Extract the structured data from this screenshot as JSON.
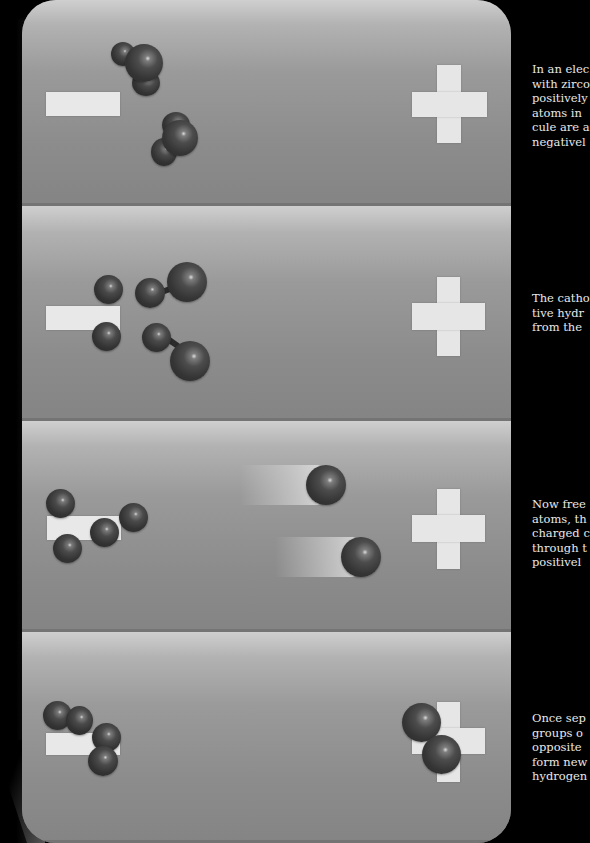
{
  "diagram": {
    "panels": [
      {
        "id": "panel-1",
        "cathode_symbol": "minus",
        "anode_symbol": "plus",
        "caption": "In an elec\nwith zirco\npositively\natoms in \ncule are a\nnegativel",
        "description": "Two water molecules approach the negative electrode"
      },
      {
        "id": "panel-2",
        "cathode_symbol": "minus",
        "anode_symbol": "plus",
        "caption": "The catho\ntive hydr\nfrom the ",
        "description": "Hydrogen atoms are pulled off, leaving oxygen ions bonded"
      },
      {
        "id": "panel-3",
        "cathode_symbol": "minus",
        "anode_symbol": "plus",
        "caption": "Now free\natoms, th\ncharged c\nthrough t\npositivel",
        "description": "Freed oxygen ions migrate to the positive electrode (motion trails)"
      },
      {
        "id": "panel-4",
        "cathode_symbol": "minus",
        "anode_symbol": "plus",
        "caption": "Once sep\ngroups o\nopposite \nform new\nhydrogen",
        "description": "Hydrogen molecules form at cathode, oxygen molecule at anode"
      }
    ]
  },
  "colors": {
    "background": "#000000",
    "panel_top": "#cfcfcf",
    "panel_bottom": "#848484",
    "electrode_symbol": "#e6e6e6",
    "atom": "#333333",
    "caption_text": "#e8e8e8"
  }
}
